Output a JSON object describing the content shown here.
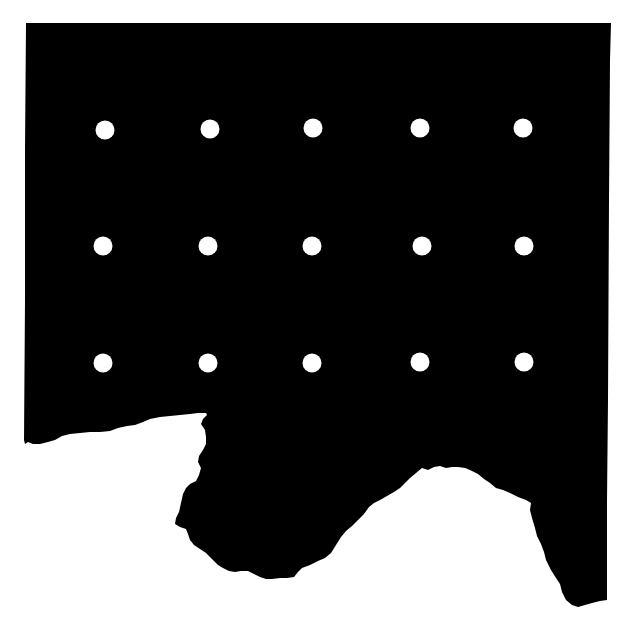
{
  "figure": {
    "background": "#ffffff",
    "shape_color": "#000000",
    "dot_color": "#ffffff",
    "dot_radius": 9.5,
    "grid": {
      "rows": 3,
      "cols": 5
    },
    "dots": [
      {
        "x": 105,
        "y": 130
      },
      {
        "x": 210,
        "y": 129
      },
      {
        "x": 313,
        "y": 128
      },
      {
        "x": 420,
        "y": 128
      },
      {
        "x": 523,
        "y": 128
      },
      {
        "x": 103,
        "y": 246
      },
      {
        "x": 208,
        "y": 246
      },
      {
        "x": 312,
        "y": 246
      },
      {
        "x": 422,
        "y": 246
      },
      {
        "x": 524,
        "y": 246
      },
      {
        "x": 103,
        "y": 363
      },
      {
        "x": 208,
        "y": 363
      },
      {
        "x": 312,
        "y": 363
      },
      {
        "x": 420,
        "y": 362
      },
      {
        "x": 524,
        "y": 362
      }
    ]
  }
}
